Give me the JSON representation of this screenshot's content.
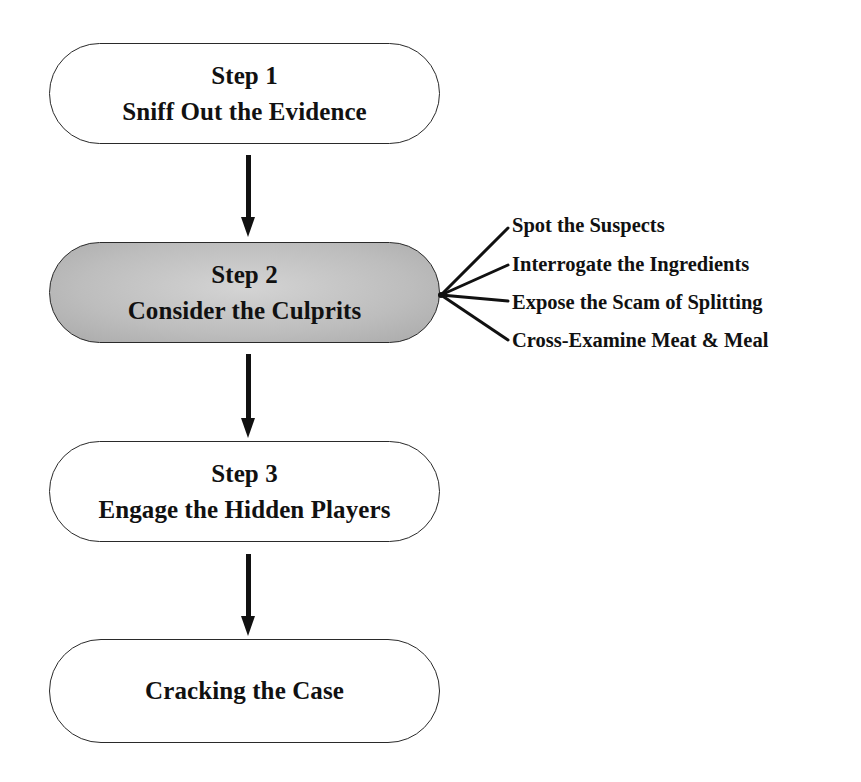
{
  "diagram": {
    "type": "flowchart",
    "steps": [
      {
        "label": "Step 1",
        "title": "Sniff Out the Evidence",
        "highlighted": false
      },
      {
        "label": "Step 2",
        "title": "Consider the Culprits",
        "highlighted": true
      },
      {
        "label": "Step 3",
        "title": "Engage the Hidden Players",
        "highlighted": false
      },
      {
        "label": "",
        "title": "Cracking the Case",
        "highlighted": false
      }
    ],
    "step2_subitems": [
      "Spot the Suspects",
      "Interrogate the Ingredients",
      "Expose the Scam of Splitting",
      "Cross-Examine Meat & Meal"
    ],
    "colors": {
      "outline": "#2a2a2a",
      "highlight_fill": "#bdbdbd",
      "text": "#111111"
    }
  }
}
